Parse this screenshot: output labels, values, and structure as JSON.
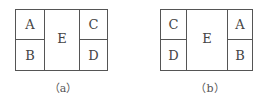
{
  "figures": [
    {
      "caption": "（a）",
      "cells": {
        "top_left": "A",
        "bottom_left": "B",
        "center": "E",
        "top_right": "C",
        "bottom_right": "D"
      }
    },
    {
      "caption": "（b）",
      "cells": {
        "top_left": "C",
        "bottom_left": "D",
        "center": "E",
        "top_right": "A",
        "bottom_right": "B"
      }
    }
  ]
}
